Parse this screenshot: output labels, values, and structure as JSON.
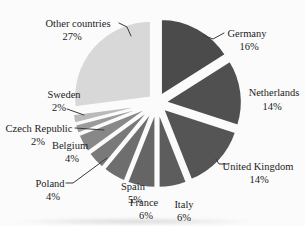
{
  "figure": {
    "background_color": "#fbfbfb",
    "text_color": "#1b1b1b",
    "leader_line_color": "#3a3a3a"
  },
  "chart_data": {
    "type": "pie",
    "variant": "exploded",
    "title": "",
    "unit": "%",
    "direction": "clockwise",
    "start_angle_deg": 0,
    "total": 100,
    "legend_position": "none (direct labels with leader lines)",
    "categories": [
      "Germany",
      "Netherlands",
      "United Kingdom",
      "Italy",
      "France",
      "Spain",
      "Poland",
      "Belgium",
      "Czech Republic",
      "Sweden",
      "Other countries"
    ],
    "values": [
      16,
      14,
      14,
      6,
      6,
      5,
      4,
      4,
      2,
      2,
      27
    ],
    "slices": [
      {
        "label": "Germany",
        "value": 16,
        "pct_label": "16%",
        "color": "#4b4b4b"
      },
      {
        "label": "Netherlands",
        "value": 14,
        "pct_label": "14%",
        "color": "#505050"
      },
      {
        "label": "United Kingdom",
        "value": 14,
        "pct_label": "14%",
        "color": "#555555"
      },
      {
        "label": "Italy",
        "value": 6,
        "pct_label": "6%",
        "color": "#5d5d5d"
      },
      {
        "label": "France",
        "value": 6,
        "pct_label": "6%",
        "color": "#656565"
      },
      {
        "label": "Spain",
        "value": 5,
        "pct_label": "5%",
        "color": "#6e6e6e"
      },
      {
        "label": "Poland",
        "value": 4,
        "pct_label": "4%",
        "color": "#797979"
      },
      {
        "label": "Belgium",
        "value": 4,
        "pct_label": "4%",
        "color": "#888888"
      },
      {
        "label": "Czech Republic",
        "value": 2,
        "pct_label": "2%",
        "color": "#9b9b9b"
      },
      {
        "label": "Sweden",
        "value": 2,
        "pct_label": "2%",
        "color": "#bababa"
      },
      {
        "label": "Other countries",
        "value": 27,
        "pct_label": "27%",
        "color": "#d8d8d8"
      }
    ]
  }
}
